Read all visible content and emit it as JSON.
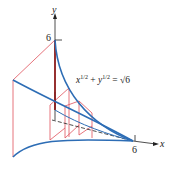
{
  "diagram": {
    "equation_label": {
      "x_term": "x",
      "x_exp": "1/2",
      "plus": "+",
      "y_term": "y",
      "y_exp": "1/2",
      "equals": "=",
      "rhs": "√6"
    },
    "axes": {
      "x_label": "x",
      "y_label": "y",
      "x_tick": "6",
      "y_tick": "6"
    },
    "colors": {
      "curve": "#2d6db5",
      "cross_section": "#e0505a",
      "axis": "#222222",
      "highlight_edge": "#8b1a1a"
    }
  }
}
